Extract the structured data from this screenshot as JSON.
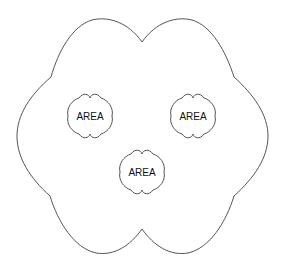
{
  "diagram": {
    "outer_shape": {
      "stroke": "#555555"
    },
    "areas": [
      {
        "label": "AREA",
        "cx": 90,
        "cy": 116
      },
      {
        "label": "AREA",
        "cx": 193,
        "cy": 116
      },
      {
        "label": "AREA",
        "cx": 142,
        "cy": 172
      }
    ]
  }
}
